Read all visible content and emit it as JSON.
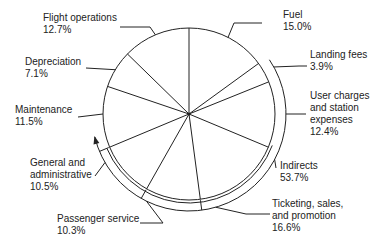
{
  "chart_data": {
    "type": "pie",
    "title": "",
    "start_angle_deg": 0,
    "direction": "clockwise",
    "slices": [
      {
        "label": "Fuel",
        "value": 15.0,
        "display": "15.0%"
      },
      {
        "label": "Landing fees",
        "value": 3.9,
        "display": "3.9%"
      },
      {
        "label": "User charges and station expenses",
        "value": 12.4,
        "display": "12.4%"
      },
      {
        "label": "Ticketing, sales, and promotion",
        "value": 16.6,
        "display": "16.6%"
      },
      {
        "label": "Passenger service",
        "value": 10.3,
        "display": "10.3%"
      },
      {
        "label": "General and administrative",
        "value": 10.5,
        "display": "10.5%"
      },
      {
        "label": "Maintenance",
        "value": 11.5,
        "display": "11.5%"
      },
      {
        "label": "Depreciation",
        "value": 7.1,
        "display": "7.1%"
      },
      {
        "label": "Flight operations",
        "value": 12.7,
        "display": "12.7%"
      }
    ],
    "group_annotation": {
      "label": "Indirects",
      "value": 53.7,
      "display": "53.7%",
      "members": [
        "Landing fees",
        "User charges and station expenses",
        "Ticketing, sales, and promotion",
        "Passenger service",
        "General and administrative"
      ]
    }
  },
  "labels": {
    "fuel": {
      "lines": [
        "Fuel",
        "15.0%"
      ]
    },
    "landing": {
      "lines": [
        "Landing fees",
        "3.9%"
      ]
    },
    "user": {
      "lines": [
        "User charges",
        "and station",
        "expenses",
        "12.4%"
      ]
    },
    "indirects": {
      "lines": [
        "Indirects",
        "53.7%"
      ]
    },
    "ticketing": {
      "lines": [
        "Ticketing, sales,",
        "and promotion",
        "16.6%"
      ]
    },
    "passenger": {
      "lines": [
        "Passenger service",
        "10.3%"
      ]
    },
    "general": {
      "lines": [
        "General and",
        "administrative",
        "10.5%"
      ]
    },
    "maintenance": {
      "lines": [
        "Maintenance",
        "11.5%"
      ]
    },
    "depreciation": {
      "lines": [
        "Depreciation",
        "7.1%"
      ]
    },
    "flight": {
      "lines": [
        "Flight operations",
        "12.7%"
      ]
    }
  }
}
